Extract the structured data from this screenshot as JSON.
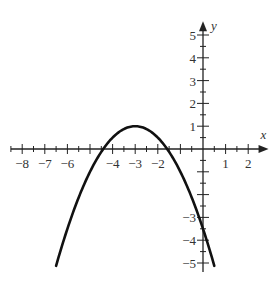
{
  "chart_data": {
    "type": "line",
    "title": "",
    "xlabel": "x",
    "ylabel": "y",
    "xlim": [
      -8.5,
      2.9
    ],
    "ylim": [
      -5.4,
      5.6
    ],
    "grid": false,
    "x_tick_labels": [
      "-8",
      "-7",
      "-6",
      "-4",
      "-3",
      "-2",
      "1",
      "2"
    ],
    "x_tick_values": [
      -8,
      -7,
      -6,
      -4,
      -3,
      -2,
      1,
      2
    ],
    "y_tick_labels": [
      "5",
      "4",
      "3",
      "2",
      "1",
      "-3",
      "-4",
      "-5"
    ],
    "y_tick_values": [
      5,
      4,
      3,
      2,
      1,
      -3,
      -4,
      -5
    ],
    "minor_tick_step": 0.5,
    "series": [
      {
        "name": "parabola",
        "equation": "y = -0.5(x+3)^2 + 1",
        "vertex": [
          -3,
          1
        ],
        "x_intercepts": [
          -4.41,
          -1.59
        ],
        "y_intercept": -3.5,
        "x": [
          -6.5,
          -6,
          -5.5,
          -5,
          -4.5,
          -4,
          -3.5,
          -3,
          -2.5,
          -2,
          -1.5,
          -1,
          -0.5,
          0,
          0.5
        ],
        "values": [
          -5.125,
          -3.5,
          -2.125,
          -1,
          -0.125,
          0.5,
          0.875,
          1,
          0.875,
          0.5,
          -0.125,
          -1,
          -2.125,
          -3.5,
          -5.125
        ],
        "color": "#111111"
      }
    ]
  }
}
